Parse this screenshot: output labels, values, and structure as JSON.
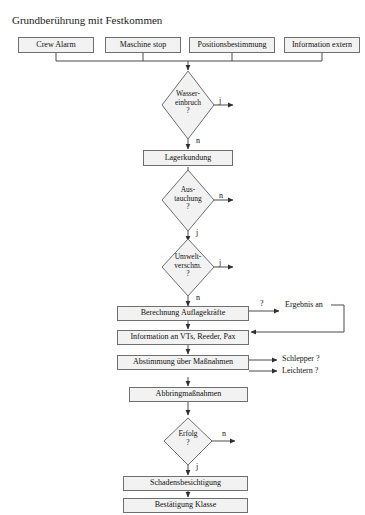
{
  "diagram": {
    "title": "Grundberührung mit Festkommen",
    "type": "flowchart",
    "language": "de"
  },
  "inputs": [
    {
      "label": "Crew Alarm"
    },
    {
      "label": "Maschine stop"
    },
    {
      "label": "Positionsbestimmung"
    },
    {
      "label": "Information extern"
    }
  ],
  "decisions": [
    {
      "id": "wassereinbruch",
      "line1": "Wasser-",
      "line2": "einbruch",
      "line3": "?",
      "branch_right": "j",
      "branch_down": "n"
    },
    {
      "id": "austauchung",
      "line1": "Aus-",
      "line2": "tauchung",
      "line3": "?",
      "branch_right": "n",
      "branch_down": "j"
    },
    {
      "id": "umweltverschmutzung",
      "line1": "Umwelt-",
      "line2": "verschm.",
      "line3": "?",
      "branch_right": "j",
      "branch_down": "n"
    },
    {
      "id": "erfolg",
      "line1": "Erfolg",
      "line2": "?",
      "line3": "",
      "branch_right": "n",
      "branch_down": "j"
    }
  ],
  "processes": [
    {
      "id": "lagerkundung",
      "label": "Lagerkundung"
    },
    {
      "id": "berechnung",
      "label": "Berechnung Auflagekräfte"
    },
    {
      "id": "information",
      "label": "Information an VTs, Reeder, Pax"
    },
    {
      "id": "abstimmung",
      "label": "Abstimmung über Maßnahmen"
    },
    {
      "id": "abbringmassnahmen",
      "label": "Abbringmaßnahmen"
    },
    {
      "id": "schadensbesichtigung",
      "label": "Schadensbesichtigung"
    },
    {
      "id": "bestaetigung",
      "label": "Bestätigung Klasse"
    }
  ],
  "side_outputs": [
    {
      "id": "ergebnis-an",
      "label": "Ergebnis an"
    },
    {
      "id": "schlepper",
      "label": "Schlepper  ?"
    },
    {
      "id": "leichtern",
      "label": "Leichtern  ?"
    }
  ],
  "edge_labels": [
    {
      "id": "berechnung-query",
      "label": "?"
    }
  ],
  "colors": {
    "node_fill": "#f2f2f2",
    "node_border": "#6f6f6f",
    "line": "#3a3a3a",
    "text": "#111111",
    "background": "#ffffff"
  }
}
